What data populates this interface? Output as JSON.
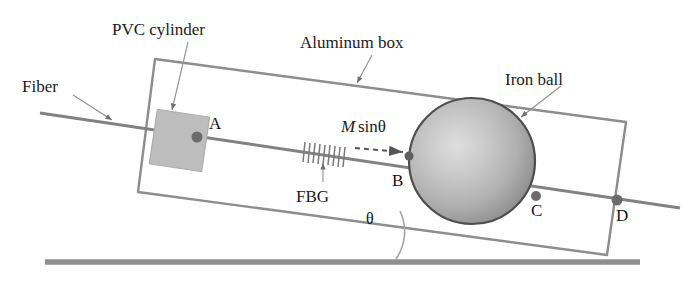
{
  "figure": {
    "type": "physics-schematic",
    "background_color": "#ffffff",
    "line_color": "#8a8a8a",
    "dark_line_color": "#6e6e6e",
    "text_color": "#1b1b1b",
    "ball_color_center": "#cfcfcf",
    "ball_color_edge": "#9a9a9a",
    "ball_outline": "#4a4a4a",
    "pvc_fill": "#bdbdbd",
    "ground_color": "#8f8f8f"
  },
  "labels": {
    "pvc_cylinder": "PVC cylinder",
    "aluminum_box": "Aluminum box",
    "fiber": "Fiber",
    "iron_ball": "Iron ball",
    "fbg": "FBG",
    "force_m": "M",
    "force_sin": "sinθ",
    "angle": "θ"
  },
  "points": {
    "a": "A",
    "b": "B",
    "c": "C",
    "d": "D"
  },
  "geometry": {
    "fiber_start": [
      40,
      113
    ],
    "fiber_end": [
      680,
      208
    ],
    "point_a": [
      197,
      137
    ],
    "point_b": [
      409,
      156
    ],
    "point_c": [
      536,
      196
    ],
    "point_d": [
      617,
      200
    ],
    "ball_center": [
      472,
      161
    ],
    "ball_radius": 63,
    "ground_y": 262,
    "ground_x1": 45,
    "ground_x2": 640,
    "box_corners": [
      [
        155,
        59
      ],
      [
        626,
        122
      ],
      [
        607,
        255
      ],
      [
        138,
        192
      ]
    ],
    "fbg_grating_x": [
      304,
      346
    ],
    "incline_angle_deg": 8.5
  }
}
